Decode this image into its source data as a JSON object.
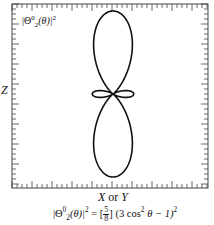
{
  "figure": {
    "type": "polar-probability-plot",
    "inset_label": {
      "prefix": "|Θ",
      "sup": "0",
      "sub": "2",
      "suffix": "(θ)|",
      "power": "2"
    },
    "axis_labels": {
      "vertical": "Z",
      "horizontal": {
        "left": "X",
        "conj": "or",
        "right": "Y"
      }
    },
    "formula": {
      "lhs_prefix": "|Θ",
      "lhs_sup": "0",
      "lhs_sub": "2",
      "lhs_suffix": "(θ)|",
      "lhs_power": "2",
      "equals": "=",
      "coef_open": "[",
      "coef_num": "5",
      "coef_den": "8",
      "coef_close": "]",
      "rhs_body": "(3 cos",
      "rhs_cos_power": "2",
      "rhs_theta": "θ − 1)",
      "rhs_power": "2"
    },
    "frame": {
      "left": 12,
      "top": 4,
      "right": 208,
      "bottom": 188
    },
    "center": {
      "x": 113,
      "y": 94
    },
    "curve": {
      "function": "(3cos^2(theta) - 1)^2",
      "max_value": 4,
      "max_radius_px": 83,
      "color": "#111111",
      "stroke_width": 1.6
    },
    "ticks": {
      "minor_spacing": 5,
      "major_every": 4,
      "minor_len": 4,
      "major_len": 7,
      "color": "#444444"
    }
  }
}
